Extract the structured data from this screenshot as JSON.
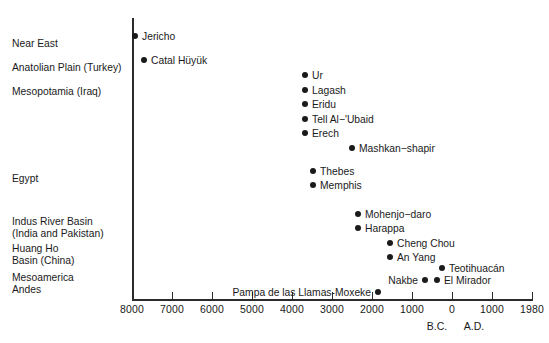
{
  "chart_data": {
    "type": "scatter",
    "title": "",
    "xlabel": "",
    "ylabel": "",
    "grid": false,
    "legend": null,
    "xaxis": {
      "tick_labels": [
        "8000",
        "7000",
        "6000",
        "5000",
        "4000",
        "3000",
        "2000",
        "1000",
        "0",
        "1000",
        "1980"
      ],
      "tick_values": [
        -8000,
        -7000,
        -6000,
        -5000,
        -4000,
        -3000,
        -2000,
        -1000,
        0,
        1000,
        1980
      ],
      "era_markers": [
        {
          "label": "B.C.",
          "value": -700
        },
        {
          "label": "A.D.",
          "value": 300
        }
      ],
      "xlim": [
        -8200,
        1980
      ],
      "note": "Years before/after year 0; left side B.C., right side A.D."
    },
    "regions": [
      {
        "name": "Near East",
        "lines": [
          "Near East"
        ]
      },
      {
        "name": "Anatolian Plain (Turkey)",
        "lines": [
          "Anatolian Plain (Turkey)"
        ]
      },
      {
        "name": "Mesopotamia (Iraq)",
        "lines": [
          "Mesopotamia (Iraq)"
        ]
      },
      {
        "name": "Egypt",
        "lines": [
          "Egypt"
        ]
      },
      {
        "name": "Indus River Basin (India and Pakistan)",
        "lines": [
          "Indus River Basin",
          "(India and Pakistan)"
        ]
      },
      {
        "name": "Huang Ho Basin (China)",
        "lines": [
          "Huang Ho",
          "Basin (China)"
        ]
      },
      {
        "name": "Mesoamerica / Andes",
        "lines": [
          "Mesoamerica",
          "Andes"
        ]
      }
    ],
    "points": [
      {
        "label": "Jericho",
        "region": "Near East",
        "year": -8000,
        "label_side": "right"
      },
      {
        "label": "Catal Hüyük",
        "region": "Anatolian Plain (Turkey)",
        "year": -7800,
        "label_side": "right"
      },
      {
        "label": "Ur",
        "region": "Mesopotamia (Iraq)",
        "year": -4350,
        "label_side": "right"
      },
      {
        "label": "Lagash",
        "region": "Mesopotamia (Iraq)",
        "year": -4350,
        "label_side": "right"
      },
      {
        "label": "Eridu",
        "region": "Mesopotamia (Iraq)",
        "year": -4350,
        "label_side": "right"
      },
      {
        "label": "Tell Al−'Ubaid",
        "region": "Mesopotamia (Iraq)",
        "year": -4350,
        "label_side": "right"
      },
      {
        "label": "Erech",
        "region": "Mesopotamia (Iraq)",
        "year": -4350,
        "label_side": "right"
      },
      {
        "label": "Mashkan−shapir",
        "region": "Mesopotamia (Iraq)",
        "year": -3330,
        "label_side": "right"
      },
      {
        "label": "Thebes",
        "region": "Egypt",
        "year": -4180,
        "label_side": "right"
      },
      {
        "label": "Memphis",
        "region": "Egypt",
        "year": -4180,
        "label_side": "right"
      },
      {
        "label": "Mohenjo−daro",
        "region": "Indus River Basin (India and Pakistan)",
        "year": -3200,
        "label_side": "right"
      },
      {
        "label": "Harappa",
        "region": "Indus River Basin (India and Pakistan)",
        "year": -3200,
        "label_side": "right"
      },
      {
        "label": "Cheng Chou",
        "region": "Huang Ho Basin (China)",
        "year": -2500,
        "label_side": "right"
      },
      {
        "label": "An Yang",
        "region": "Huang Ho Basin (China)",
        "year": -2500,
        "label_side": "right"
      },
      {
        "label": "Teotihuacán",
        "region": "Mesoamerica / Andes",
        "year": -1380,
        "label_side": "right"
      },
      {
        "label": "Nakbe",
        "region": "Mesoamerica / Andes",
        "year": -1750,
        "label_side": "left"
      },
      {
        "label": "El Mirador",
        "region": "Mesoamerica / Andes",
        "year": -1490,
        "label_side": "right"
      },
      {
        "label": "Pampa de las Llamas-Moxeke",
        "region": "Mesoamerica / Andes",
        "year": -2600,
        "label_side": "left"
      }
    ]
  },
  "colors": {
    "ink": "#1a1a1a",
    "axis": "#2b2b2b",
    "background": "#ffffff",
    "point": "#1a1a1a"
  },
  "layout": {
    "region_label_y": [
      38,
      62,
      86,
      173,
      216,
      243,
      272
    ],
    "point_x": [
      135,
      144,
      305,
      305,
      305,
      305,
      305,
      352,
      313,
      313,
      358,
      358,
      390,
      390,
      442,
      425,
      437,
      378
    ],
    "point_y": [
      36,
      60,
      75,
      90,
      104,
      119,
      133,
      148,
      171,
      185,
      214,
      228,
      243,
      257,
      268,
      280,
      280,
      292
    ],
    "tick_x": [
      132,
      172,
      212,
      252,
      292,
      332,
      372,
      412,
      452,
      492,
      532
    ],
    "era_x": [
      437,
      474
    ]
  }
}
